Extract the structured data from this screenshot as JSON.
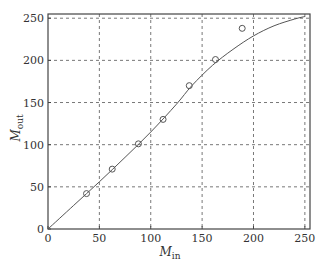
{
  "chart_data": {
    "type": "scatter",
    "title": "",
    "xlabel": "M_in",
    "xlabel_main": "M",
    "xlabel_sub": "in",
    "ylabel": "M_out",
    "ylabel_main": "M",
    "ylabel_sub": "out",
    "xlim": [
      0,
      255
    ],
    "ylim": [
      0,
      255
    ],
    "xticks": [
      0,
      50,
      100,
      150,
      200,
      250
    ],
    "yticks": [
      0,
      50,
      100,
      150,
      200,
      250
    ],
    "grid": true,
    "grid_style": "dashed",
    "legend": null,
    "series": [
      {
        "name": "measured",
        "kind": "scatter",
        "marker": "open-circle",
        "x": [
          37.5,
          62.5,
          88,
          112,
          137.5,
          163,
          189
        ],
        "y": [
          42,
          71,
          101,
          130,
          170,
          201,
          238
        ]
      },
      {
        "name": "fit",
        "kind": "line",
        "x": [
          0,
          25,
          50,
          75,
          100,
          125,
          140,
          160,
          180,
          200,
          220,
          240,
          250
        ],
        "y": [
          0,
          28,
          56,
          85,
          115,
          148,
          170,
          194,
          213,
          229,
          241,
          249,
          252
        ]
      }
    ]
  },
  "colors": {
    "axis": "#444444",
    "grid": "#555555",
    "line": "#555555",
    "marker": "#555555"
  }
}
